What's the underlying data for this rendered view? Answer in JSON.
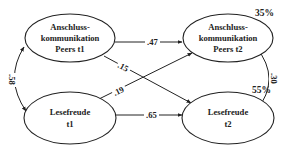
{
  "diagram": {
    "type": "cross-lagged path model",
    "nodes": [
      {
        "id": "anschluss_t1",
        "lines": [
          "Anschluss-",
          "kommunikation",
          "Peers t1"
        ]
      },
      {
        "id": "lesefreude_t1",
        "lines": [
          "Lesefreude",
          "t1"
        ]
      },
      {
        "id": "anschluss_t2",
        "lines": [
          "Anschluss-",
          "kommunikation",
          "Peers t2"
        ]
      },
      {
        "id": "lesefreude_t2",
        "lines": [
          "Lesefreude",
          "t2"
        ]
      }
    ],
    "edges": [
      {
        "from": "anschluss_t1",
        "to": "anschluss_t2",
        "label": ".47",
        "kind": "path"
      },
      {
        "from": "anschluss_t1",
        "to": "lesefreude_t2",
        "label": ".15",
        "kind": "path"
      },
      {
        "from": "lesefreude_t1",
        "to": "anschluss_t2",
        "label": ".19",
        "kind": "path"
      },
      {
        "from": "lesefreude_t1",
        "to": "lesefreude_t2",
        "label": ".65",
        "kind": "path"
      },
      {
        "from": "anschluss_t1",
        "to": "lesefreude_t1",
        "label": ".58",
        "kind": "correlation"
      },
      {
        "from": "anschluss_t2",
        "to": "lesefreude_t2",
        "label": ".30",
        "kind": "correlation"
      }
    ],
    "explained_variance": {
      "anschluss_t2": "35%",
      "lesefreude_t2": "55%"
    }
  }
}
